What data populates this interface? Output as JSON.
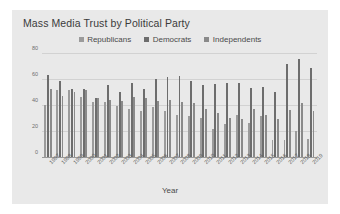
{
  "chart_data": {
    "type": "bar",
    "title": "Mass Media Trust by Political Party",
    "xlabel": "Year",
    "ylabel": "",
    "ylim": [
      0,
      80
    ],
    "yticks": [
      0,
      20,
      40,
      60,
      80
    ],
    "grid": true,
    "legend_position": "top-center",
    "categories": [
      "1997",
      "1998",
      "1999",
      "2000",
      "2001",
      "2002",
      "2003",
      "2004",
      "2005",
      "2006",
      "2007",
      "2008",
      "2009",
      "2010",
      "2011",
      "2012",
      "2013",
      "2014",
      "2015",
      "2016",
      "2017",
      "2018",
      "2019"
    ],
    "series": [
      {
        "name": "Republicans",
        "color": "#9b9b9b",
        "values": [
          41,
          52,
          52,
          47,
          43,
          43,
          40,
          38,
          36,
          39,
          36,
          33,
          32,
          31,
          22,
          26,
          33,
          27,
          32,
          14,
          14,
          21,
          15
        ]
      },
      {
        "name": "Democrats",
        "color": "#6d6d6d",
        "values": [
          64,
          59,
          53,
          53,
          46,
          56,
          51,
          58,
          53,
          61,
          62,
          63,
          59,
          56,
          57,
          58,
          58,
          54,
          55,
          51,
          72,
          76,
          69
        ]
      },
      {
        "name": "Independents",
        "color": "#8a8a8a",
        "values": [
          53,
          48,
          51,
          52,
          46,
          45,
          44,
          47,
          46,
          44,
          45,
          43,
          42,
          38,
          35,
          31,
          30,
          38,
          33,
          30,
          37,
          42,
          36
        ]
      }
    ]
  },
  "legend": {
    "items": [
      {
        "label": "Republicans"
      },
      {
        "label": "Democrats"
      },
      {
        "label": "Independents"
      }
    ]
  },
  "colors": {
    "card_background": "#e9e9e9",
    "page_background": "#ffffff",
    "gridline": "#d2d2d2",
    "axis": "#9a9a9a",
    "title_text": "#3b3b3b",
    "tick_text": "#6e6e6e"
  }
}
